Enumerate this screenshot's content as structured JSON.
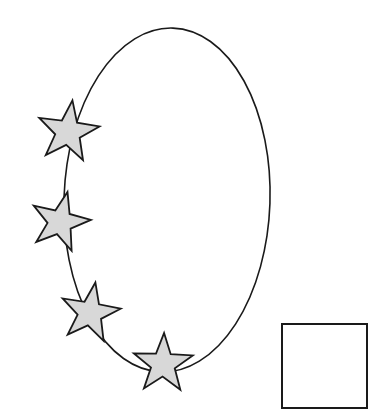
{
  "canvas": {
    "width": 391,
    "height": 413,
    "background_color": "#ffffff",
    "title": "Ellipse with four stars and a square"
  },
  "style": {
    "stroke_color": "#1a1a1a",
    "star_fill_color": "#d8d8d8",
    "square_fill_color": "#ffffff",
    "ellipse_stroke_width": 1.6,
    "star_stroke_width": 1.8,
    "square_stroke_width": 2.0
  },
  "shapes": {
    "ellipse": {
      "name": "ellipse",
      "label": "ellipse",
      "cx": 167,
      "cy": 200,
      "rx": 103,
      "ry": 172,
      "rotation_deg": 2,
      "filled": false
    },
    "square": {
      "name": "square",
      "label": "square",
      "x": 282,
      "y": 324,
      "width": 85,
      "height": 84,
      "filled": false
    },
    "stars": [
      {
        "name": "star-1",
        "label": "star 1",
        "cx": 68,
        "cy": 132,
        "outer_radius": 32,
        "inner_radius": 13,
        "rotation_deg": 8,
        "filled": true
      },
      {
        "name": "star-2",
        "label": "star 2",
        "cx": 60,
        "cy": 222,
        "outer_radius": 31,
        "inner_radius": 12.5,
        "rotation_deg": 14,
        "filled": true
      },
      {
        "name": "star-3",
        "label": "star 3",
        "cx": 90,
        "cy": 313,
        "outer_radius": 31,
        "inner_radius": 12.5,
        "rotation_deg": 10,
        "filled": true
      },
      {
        "name": "star-4",
        "label": "star 4",
        "cx": 163,
        "cy": 364,
        "outer_radius": 31,
        "inner_radius": 12.5,
        "rotation_deg": 2,
        "filled": true
      }
    ]
  }
}
